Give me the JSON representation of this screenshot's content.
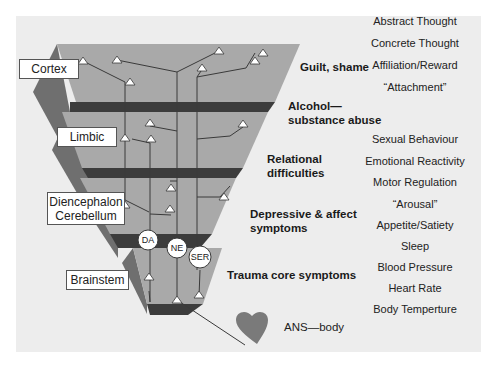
{
  "diagram": {
    "type": "neurodevelopmental hierarchy",
    "colors": {
      "panel_bg": "#ededed",
      "layer_top": "#a9a9a9",
      "layer_side": "#6f6f6f",
      "separator": "#3c3c3c",
      "heart": "#7a7a7a"
    },
    "regions": [
      {
        "label": "Cortex"
      },
      {
        "label": "Limbic"
      },
      {
        "label_line1": "Diencephalon",
        "label_line2": "Cerebellum"
      },
      {
        "label": "Brainstem"
      }
    ],
    "symptoms": [
      {
        "line1": "Guilt, shame"
      },
      {
        "line1": "Alcohol—",
        "line2": "substance abuse"
      },
      {
        "line1": "Relational",
        "line2": "difficulties"
      },
      {
        "line1": "Depressive & affect",
        "line2": "symptoms"
      },
      {
        "line1": "Trauma core symptoms"
      }
    ],
    "functions": [
      "Abstract Thought",
      "Concrete Thought",
      "Affiliation/Reward",
      "“Attachment”",
      "Sexual Behaviour",
      "Emotional Reactivity",
      "Motor Regulation",
      "“Arousal”",
      "Appetite/Satiety",
      "Sleep",
      "Blood Pressure",
      "Heart Rate",
      "Body Temperture"
    ],
    "neurotransmitters": [
      "DA",
      "NE",
      "SER"
    ],
    "body": {
      "label": "ANS—body",
      "icon": "heart-icon"
    }
  }
}
